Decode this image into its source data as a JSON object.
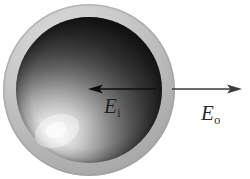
{
  "figure": {
    "name": "dielectric-sphere-electric-field-diagram",
    "background_color": "#ffffff",
    "width": 250,
    "height": 179
  },
  "sphere": {
    "shell": {
      "name": "outer-shell",
      "center_x": 89,
      "center_y": 90,
      "radius": 86,
      "color": "#b9b9b9",
      "highlight_color": "#d7d7d7",
      "shadow_color": "#9a9a9a"
    },
    "core": {
      "name": "inner-sphere",
      "center_x": 89,
      "center_y": 90,
      "radius": 73,
      "dark_color": "#1a1a1a",
      "mid_color": "#6e6e6e",
      "highlight_color": "#f2f2f2",
      "highlight_x": 56,
      "highlight_y": 131
    }
  },
  "vectors": [
    {
      "name": "inner-field-vector",
      "direction": "left",
      "tail_x": 156,
      "tail_y": 89,
      "head_x": 89,
      "head_y": 89,
      "color": "#111111",
      "stroke_width": 1.6
    },
    {
      "name": "outer-field-vector",
      "direction": "right",
      "tail_x": 172,
      "tail_y": 89,
      "head_x": 241,
      "head_y": 89,
      "color": "#3a3a3a",
      "stroke_width": 1.4
    }
  ],
  "labels": {
    "inner": {
      "symbol": "E",
      "subscript": "i",
      "full": "E_i",
      "meaning": "internal electric field"
    },
    "outer": {
      "symbol": "E",
      "subscript": "o",
      "full": "E_o",
      "meaning": "external electric field"
    }
  }
}
